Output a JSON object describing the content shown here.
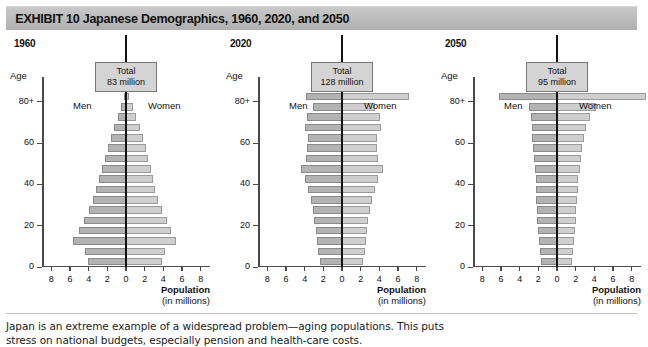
{
  "header": {
    "exhibit_number": "EXHIBIT 10",
    "title": "Japanese Demographics, 1960, 2020, and 2050",
    "full_text": "EXHIBIT 10   Japanese Demographics, 1960, 2020, and 2050",
    "bar_color": "#bdbdbd"
  },
  "caption": {
    "line1": "Japan is an extreme example of a widespread problem—aging populations. This puts",
    "line2": "stress on national budgets, especially pension and health-care costs."
  },
  "common": {
    "age_axis_label": "Age",
    "men_label": "Men",
    "women_label": "Women",
    "total_prefix": "Total",
    "x_axis_title_line1": "Population",
    "x_axis_title_line2": "(in millions)",
    "x_ticks": [
      8,
      6,
      4,
      2,
      0,
      2,
      4,
      6,
      8
    ],
    "x_tick_values": [
      -8,
      -6,
      -4,
      -2,
      0,
      2,
      4,
      6,
      8
    ],
    "y_ticks": [
      "80+",
      "60",
      "40",
      "20",
      "0"
    ],
    "y_tick_values": [
      80,
      60,
      40,
      20,
      0
    ],
    "xlim": [
      -9,
      9
    ],
    "men_bar_color": "#b3b3b3",
    "women_bar_color": "#cfcfcf",
    "total_box_color": "#d4d4d4"
  },
  "chart_data": [
    {
      "type": "bar",
      "subtype": "population-pyramid",
      "title": "1960",
      "total_label": "Total",
      "total_value": "83 million",
      "xlabel": "Population (in millions)",
      "ylabel": "Age",
      "xlim": [
        -9,
        9
      ],
      "grid": false,
      "age_groups": [
        "0-4",
        "5-9",
        "10-14",
        "15-19",
        "20-24",
        "25-29",
        "30-34",
        "35-39",
        "40-44",
        "45-49",
        "50-54",
        "55-59",
        "60-64",
        "65-69",
        "70-74",
        "75-79",
        "80+"
      ],
      "series": [
        {
          "name": "Men",
          "values": [
            4.1,
            4.4,
            5.7,
            5.0,
            4.5,
            4.0,
            3.5,
            3.2,
            2.9,
            2.6,
            2.3,
            1.9,
            1.6,
            1.3,
            0.9,
            0.5,
            0.25
          ]
        },
        {
          "name": "Women",
          "values": [
            3.9,
            4.2,
            5.4,
            4.8,
            4.4,
            3.9,
            3.4,
            3.1,
            2.9,
            2.7,
            2.4,
            2.1,
            1.8,
            1.5,
            1.1,
            0.7,
            0.35
          ]
        }
      ]
    },
    {
      "type": "bar",
      "subtype": "population-pyramid",
      "title": "2020",
      "total_label": "Total",
      "total_value": "128 million",
      "xlabel": "Population (in millions)",
      "ylabel": "Age",
      "xlim": [
        -9,
        9
      ],
      "grid": false,
      "age_groups": [
        "0-4",
        "5-9",
        "10-14",
        "15-19",
        "20-24",
        "25-29",
        "30-34",
        "35-39",
        "40-44",
        "45-49",
        "50-54",
        "55-59",
        "60-64",
        "65-69",
        "70-74",
        "75-79",
        "80+"
      ],
      "series": [
        {
          "name": "Men",
          "values": [
            2.4,
            2.6,
            2.7,
            2.8,
            3.0,
            3.1,
            3.3,
            3.6,
            4.0,
            4.4,
            3.9,
            3.7,
            3.6,
            4.0,
            3.8,
            3.1,
            3.9
          ]
        },
        {
          "name": "Women",
          "values": [
            2.3,
            2.5,
            2.6,
            2.7,
            2.8,
            3.0,
            3.2,
            3.5,
            3.9,
            4.4,
            3.9,
            3.8,
            3.7,
            4.2,
            4.1,
            3.5,
            7.2
          ]
        }
      ]
    },
    {
      "type": "bar",
      "subtype": "population-pyramid",
      "title": "2050",
      "total_label": "Total",
      "total_value": "95 million",
      "xlabel": "Population (in millions)",
      "ylabel": "Age",
      "xlim": [
        -9,
        9
      ],
      "grid": false,
      "age_groups": [
        "0-4",
        "5-9",
        "10-14",
        "15-19",
        "20-24",
        "25-29",
        "30-34",
        "35-39",
        "40-44",
        "45-49",
        "50-54",
        "55-59",
        "60-64",
        "65-69",
        "70-74",
        "75-79",
        "80+"
      ],
      "series": [
        {
          "name": "Men",
          "values": [
            1.7,
            1.8,
            1.9,
            2.0,
            2.1,
            2.1,
            2.2,
            2.2,
            2.3,
            2.4,
            2.5,
            2.6,
            2.7,
            2.7,
            2.8,
            3.0,
            6.2
          ]
        },
        {
          "name": "Women",
          "values": [
            1.6,
            1.7,
            1.8,
            1.9,
            2.0,
            2.0,
            2.1,
            2.2,
            2.3,
            2.5,
            2.6,
            2.7,
            2.9,
            3.1,
            3.5,
            4.2,
            9.5
          ]
        }
      ]
    }
  ]
}
